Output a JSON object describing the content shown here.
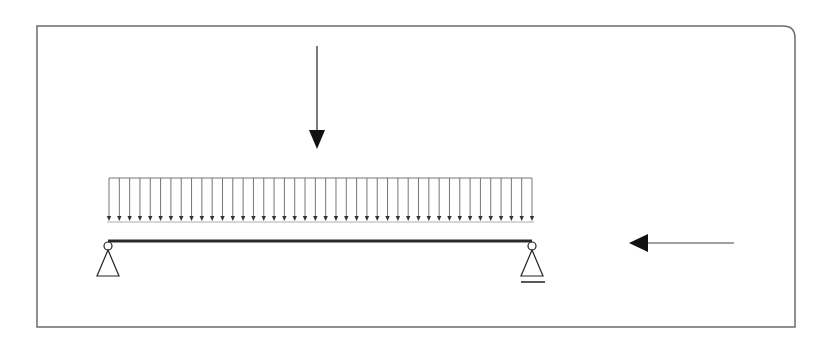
{
  "diagram": {
    "title": "",
    "colors": {
      "background": "#ffffff",
      "frame": "#6b6b6b",
      "beam": "#2a2a2a",
      "load_lines": "#777777",
      "arrows": "#111111"
    },
    "beam": {
      "label": "",
      "supports": [
        {
          "type": "pin",
          "position": "left-end"
        },
        {
          "type": "roller",
          "position": "right-end"
        }
      ]
    },
    "loads": {
      "distributed": {
        "label": "",
        "direction": "down",
        "arrow_count": 42,
        "span": "full-beam"
      },
      "point": {
        "label": "",
        "direction": "down",
        "position_fraction": 0.5
      },
      "axial": {
        "label": "",
        "direction": "left",
        "position": "right-of-beam"
      }
    }
  }
}
